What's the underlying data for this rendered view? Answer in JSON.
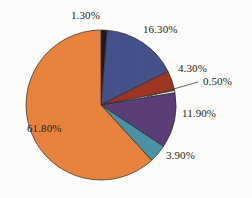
{
  "chart_data": {
    "type": "pie",
    "title": "",
    "subtitle": "",
    "xlabel": "",
    "ylabel": "",
    "legend_position": "none",
    "grid": false,
    "value_suffix": "%",
    "start_angle_deg": 0,
    "direction": "clockwise",
    "categories": [
      "slice-1",
      "slice-2",
      "slice-3",
      "slice-4",
      "slice-5",
      "slice-6",
      "slice-7"
    ],
    "values": [
      1.3,
      16.3,
      4.3,
      0.5,
      11.9,
      3.9,
      61.8
    ],
    "labels": [
      "1.30%",
      "16.30%",
      "4.30%",
      "0.50%",
      "11.90%",
      "3.90%",
      "61.80%"
    ],
    "colors": [
      "#1b1b2e",
      "#45518b",
      "#9e3620",
      "#f4f2ef",
      "#5c3f78",
      "#4a92a8",
      "#e8823c"
    ],
    "slices": [
      {
        "name": "slice-1",
        "value": 1.3,
        "label": "1.30%",
        "color": "#1b1b2e",
        "label_position": "outside",
        "label_x": 71,
        "label_y": 10,
        "leader": false
      },
      {
        "name": "slice-2",
        "value": 16.3,
        "label": "16.30%",
        "color": "#45518b",
        "label_position": "outside",
        "label_x": 143,
        "label_y": 24,
        "leader": false
      },
      {
        "name": "slice-3",
        "value": 4.3,
        "label": "4.30%",
        "color": "#9e3620",
        "label_position": "outside",
        "label_x": 178,
        "label_y": 63,
        "leader": false
      },
      {
        "name": "slice-4",
        "value": 0.5,
        "label": "0.50%",
        "color": "#f4f2ef",
        "label_position": "outside",
        "label_x": 203,
        "label_y": 76,
        "leader": true
      },
      {
        "name": "slice-5",
        "value": 11.9,
        "label": "11.90%",
        "color": "#5c3f78",
        "label_position": "outside",
        "label_x": 182,
        "label_y": 108,
        "leader": false
      },
      {
        "name": "slice-6",
        "value": 3.9,
        "label": "3.90%",
        "color": "#4a92a8",
        "label_position": "outside",
        "label_x": 166,
        "label_y": 150,
        "leader": false
      },
      {
        "name": "slice-7",
        "value": 61.8,
        "label": "61.80%",
        "color": "#e8823c",
        "label_position": "inside",
        "label_x": 27,
        "label_y": 123,
        "leader": false
      }
    ],
    "geometry": {
      "center_x": 101,
      "center_y": 105,
      "radius": 75,
      "stroke_color": "#2a2a2a",
      "stroke_width": 0.7
    },
    "background_color": "#fdfdfc"
  }
}
